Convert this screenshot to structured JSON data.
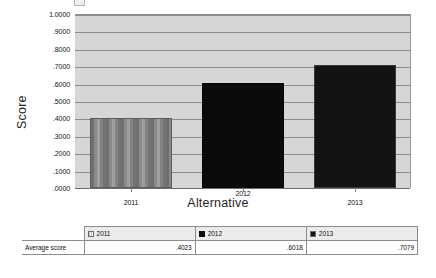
{
  "chart_data": {
    "type": "bar",
    "title": "",
    "xlabel": "Alternative",
    "ylabel": "Score",
    "categories": [
      "2011",
      "2012",
      "2013"
    ],
    "values": [
      0.4023,
      0.6018,
      0.7079
    ],
    "value_labels": [
      ".4023",
      ".6018",
      ".7079"
    ],
    "series": [
      {
        "name": "Average score",
        "values": [
          0.4023,
          0.6018,
          0.7079
        ]
      }
    ],
    "ylim": [
      0.0,
      1.0
    ],
    "ytick_step": 0.1,
    "ytick_labels": [
      ".0000",
      ".1000",
      ".2000",
      ".3000",
      ".4000",
      ".5000",
      ".6000",
      ".7000",
      ".8000",
      ".9000",
      "1.0000"
    ],
    "ytick_values": [
      0.0,
      0.1,
      0.2,
      0.3,
      0.4,
      0.5,
      0.6,
      0.7,
      0.8,
      0.9,
      1.0
    ],
    "grid": true,
    "grid_axis": "y",
    "legend_position": "table-below",
    "bar_styles": [
      "striped-gray",
      "solid-black",
      "dark-outline"
    ],
    "colors": {
      "plot_background": "#d6d6d6",
      "gridline": "#8b8b8b",
      "bar_2011": "#8a8a8a",
      "bar_2012": "#0b0b0b",
      "bar_2013": "#131313",
      "page_background": "#ffffff",
      "text": "#111111"
    }
  },
  "table": {
    "corner_label": "",
    "row_header": "Average score",
    "columns": [
      {
        "label": "2011",
        "swatch": "striped-swatch-icon"
      },
      {
        "label": "2012",
        "swatch": "solid-dark-swatch-icon"
      },
      {
        "label": "2013",
        "swatch": "dark-outline-swatch-icon"
      }
    ],
    "rows": [
      {
        "label": "Average score",
        "cells": [
          ".4023",
          ".6018",
          ".7079"
        ]
      }
    ]
  }
}
